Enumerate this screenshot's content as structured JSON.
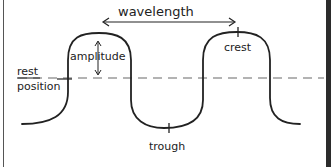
{
  "diagram": {
    "labels": {
      "wavelength": "wavelength",
      "amplitude": "amplitude",
      "crest": "crest",
      "trough": "trough",
      "rest_line1": "rest",
      "rest_line2": "position"
    },
    "colors": {
      "ink": "#222222",
      "dashed_line": "#9a9a9a",
      "background": "#ffffff",
      "frame_right": "#2b2b2b"
    }
  }
}
